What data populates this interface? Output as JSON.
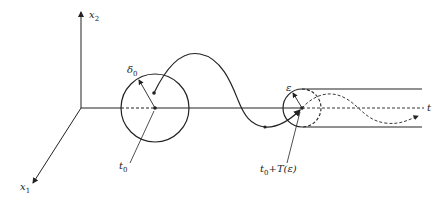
{
  "diagram": {
    "axes": {
      "x2_label": "x",
      "x2_sub": "2",
      "x1_label": "x",
      "x1_sub": "1",
      "t_label": "t"
    },
    "labels": {
      "delta0": "δ",
      "delta0_sub": "0",
      "t0": "t",
      "t0_sub": "0",
      "epsilon": "ε",
      "t0T_main": "t",
      "t0T_sub": "0",
      "t0T_rest": "+T(ε)"
    },
    "colors": {
      "stroke": "#222222",
      "background": "#ffffff"
    }
  }
}
